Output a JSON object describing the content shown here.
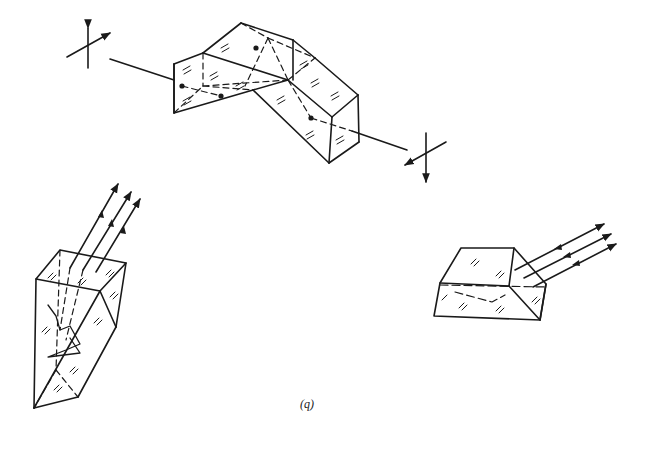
{
  "figure": {
    "caption": "(q)",
    "elements": [
      {
        "name": "double-prism-assembly",
        "description": "Two joined prisms with an optical axis passing through; polarization crosses at entry and exit"
      },
      {
        "name": "roof-prism",
        "description": "Tall prism with three parallel rays entering/exiting the top face"
      },
      {
        "name": "trapezoid-prism",
        "description": "Low trapezoidal prism with three parallel rays leaving toward upper right"
      }
    ]
  },
  "colors": {
    "ink": "#1a1a1a",
    "background": "#ffffff"
  }
}
